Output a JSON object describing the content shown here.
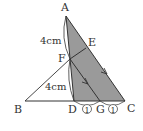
{
  "diagram": {
    "points": {
      "A": {
        "label": "A",
        "x": 66,
        "y": 16
      },
      "B": {
        "label": "B",
        "x": 25,
        "y": 101
      },
      "C": {
        "label": "C",
        "x": 125,
        "y": 101
      },
      "D": {
        "label": "D",
        "x": 74,
        "y": 101
      },
      "E": {
        "label": "E",
        "x": 86,
        "y": 48
      },
      "F": {
        "label": "F",
        "x": 70,
        "y": 59
      },
      "G": {
        "label": "G",
        "x": 100,
        "y": 101
      }
    },
    "lengths": {
      "AF": "4cm",
      "FD": "4cm"
    },
    "ratios": {
      "DG": "1",
      "GC": "1"
    },
    "colors": {
      "shade": "#9a9a9a",
      "line": "#333333",
      "background": "#ffffff"
    }
  }
}
